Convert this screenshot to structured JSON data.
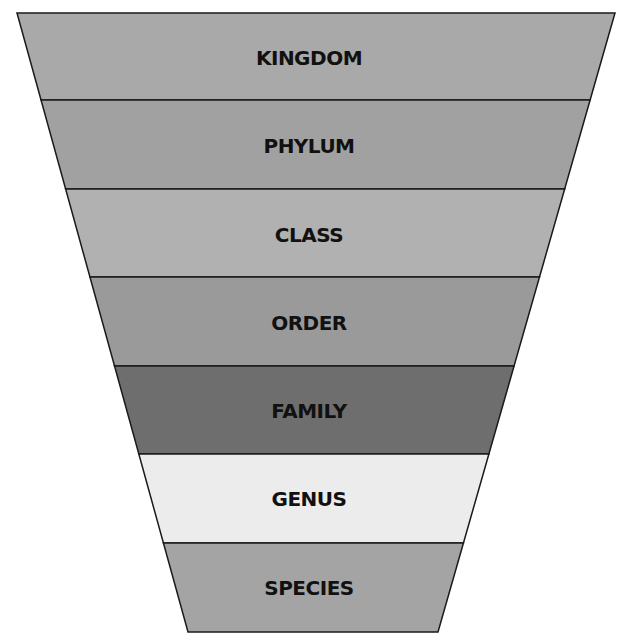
{
  "diagram": {
    "type": "funnel",
    "title": "",
    "bands": [
      {
        "label": "KINGDOM",
        "color": "#a9a9a9"
      },
      {
        "label": "PHYLUM",
        "color": "#a1a1a1"
      },
      {
        "label": "CLASS",
        "color": "#b1b1b1"
      },
      {
        "label": "ORDER",
        "color": "#9a9a9a"
      },
      {
        "label": "FAMILY",
        "color": "#6e6e6e"
      },
      {
        "label": "GENUS",
        "color": "#ececec"
      },
      {
        "label": "SPECIES",
        "color": "#a4a4a4"
      }
    ],
    "outline_color": "#1a1a1a"
  }
}
